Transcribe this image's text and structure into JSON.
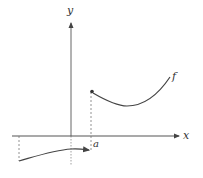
{
  "diagram": {
    "type": "function-graph",
    "labels": {
      "x_axis": "x",
      "y_axis": "y",
      "function": "f",
      "point": "a"
    },
    "colors": {
      "axis": "#555555",
      "curve": "#444444",
      "dashed": "#777777",
      "background": "#ffffff"
    },
    "annotations": [
      "Left branch lies below the x-axis and approaches x = a with an open end (arrow)",
      "Right branch starts at a filled (closed) point above x = a",
      "Dashed vertical guide lines drop from the curve endpoints to the x-axis"
    ]
  }
}
